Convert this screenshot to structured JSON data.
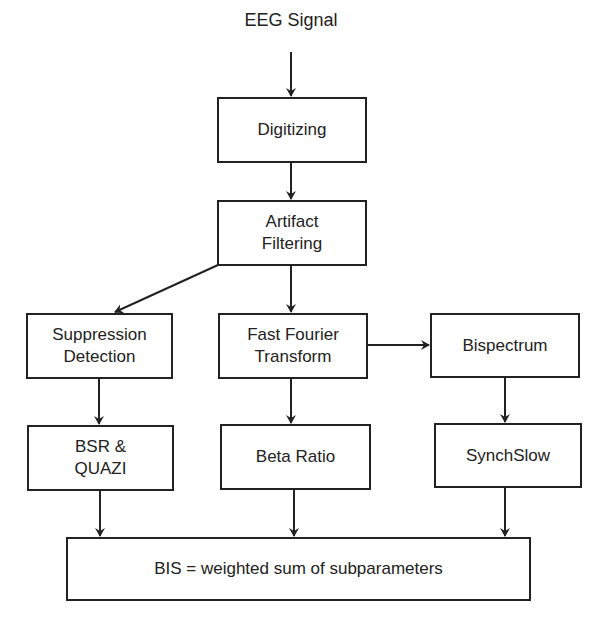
{
  "diagram": {
    "input_label": "EEG Signal",
    "nodes": {
      "digitizing": "Digitizing",
      "artifact": "Artifact\nFiltering",
      "suppression": "Suppression\nDetection",
      "fft": "Fast Fourier\nTransform",
      "bispectrum": "Bispectrum",
      "bsr": "BSR &\nQUAZI",
      "beta": "Beta Ratio",
      "synchslow": "SynchSlow",
      "bis": "BIS = weighted sum of subparameters"
    },
    "edges": [
      [
        "EEG Signal",
        "Digitizing"
      ],
      [
        "Digitizing",
        "Artifact Filtering"
      ],
      [
        "Artifact Filtering",
        "Suppression Detection"
      ],
      [
        "Artifact Filtering",
        "Fast Fourier Transform"
      ],
      [
        "Fast Fourier Transform",
        "Bispectrum"
      ],
      [
        "Suppression Detection",
        "BSR & QUAZI"
      ],
      [
        "Fast Fourier Transform",
        "Beta Ratio"
      ],
      [
        "Bispectrum",
        "SynchSlow"
      ],
      [
        "BSR & QUAZI",
        "BIS"
      ],
      [
        "Beta Ratio",
        "BIS"
      ],
      [
        "SynchSlow",
        "BIS"
      ]
    ]
  }
}
